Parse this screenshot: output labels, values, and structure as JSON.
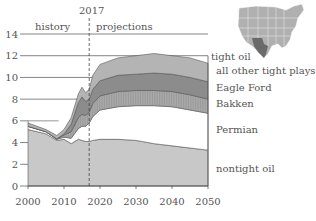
{
  "chart_data": {
    "type": "area",
    "stacked": true,
    "title": "",
    "xlabel": "",
    "ylabel": "",
    "xlim": [
      2000,
      2050
    ],
    "ylim": [
      0,
      14
    ],
    "x_ticks": [
      "2000",
      "2010",
      "2020",
      "2030",
      "2040",
      "2050"
    ],
    "y_ticks": [
      "0",
      "2",
      "4",
      "6",
      "8",
      "10",
      "12",
      "14"
    ],
    "grid": "horizontal lines at 8, 10, 12, 14",
    "annotations": {
      "divider_year": "2017",
      "left_label": "history",
      "right_label": "projections"
    },
    "x": [
      2000,
      2005,
      2008,
      2010,
      2012,
      2014,
      2015,
      2016,
      2017,
      2018,
      2020,
      2025,
      2030,
      2035,
      2040,
      2045,
      2050
    ],
    "series": [
      {
        "name": "nontight oil",
        "color": "#c8c8c8",
        "values": [
          5.2,
          4.8,
          4.2,
          4.3,
          3.9,
          4.3,
          4.2,
          4.1,
          4.1,
          4.2,
          4.3,
          4.3,
          4.2,
          3.9,
          3.7,
          3.5,
          3.3
        ]
      },
      {
        "name": "Permian",
        "color": "#ffffff",
        "values": [
          0.3,
          0.2,
          0.1,
          0.2,
          0.5,
          1.0,
          1.3,
          1.4,
          1.7,
          2.2,
          2.7,
          3.0,
          3.2,
          3.5,
          3.6,
          3.5,
          3.4
        ]
      },
      {
        "name": "Bakken",
        "color": "#a9a9a9",
        "values": [
          0.0,
          0.0,
          0.05,
          0.2,
          0.6,
          1.0,
          1.1,
          1.0,
          1.0,
          1.2,
          1.3,
          1.4,
          1.4,
          1.4,
          1.4,
          1.4,
          1.3
        ]
      },
      {
        "name": "Eagle Ford",
        "color": "#8c8c8c",
        "values": [
          0.0,
          0.0,
          0.0,
          0.1,
          0.7,
          1.4,
          1.6,
          1.3,
          1.2,
          1.3,
          1.4,
          1.5,
          1.5,
          1.6,
          1.6,
          1.6,
          1.6
        ]
      },
      {
        "name": "all other tight plays",
        "color": "#b4b4b4",
        "values": [
          0.3,
          0.2,
          0.3,
          0.4,
          0.6,
          0.8,
          0.9,
          0.8,
          0.9,
          1.3,
          1.5,
          1.6,
          1.7,
          1.8,
          1.7,
          1.8,
          1.7
        ]
      }
    ],
    "legend_group_label": "tight oil",
    "legend_position": "right, inline labels"
  },
  "labels": {
    "year": "2017",
    "history": "history",
    "projections": "projections",
    "tight_oil": "tight oil",
    "all_other": "all other tight plays",
    "eagle_ford": "Eagle Ford",
    "bakken": "Bakken",
    "permian": "Permian",
    "nontight": "nontight oil"
  },
  "inset_map": {
    "description": "U.S. map with Texas Permian/Eagle Ford region highlighted",
    "highlight_color": "#6a6a6a",
    "base_color": "#b0b0b0"
  }
}
